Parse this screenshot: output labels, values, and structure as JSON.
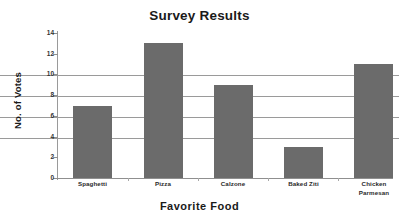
{
  "chart_data": {
    "type": "bar",
    "title": "Survey Results",
    "xlabel": "Favorite Food",
    "ylabel": "No. of Votes",
    "categories": [
      "Spaghetti",
      "Pizza",
      "Calzone",
      "Baked Ziti",
      "Chicken Parmesan"
    ],
    "values": [
      7,
      13,
      9,
      3,
      11
    ],
    "series": [
      {
        "name": "No. of Votes",
        "values": [
          7,
          13,
          9,
          3,
          11
        ]
      }
    ],
    "ylim": [
      0,
      14
    ],
    "yticks": [
      0,
      2,
      4,
      6,
      8,
      10,
      12,
      14
    ],
    "ytick_labels": [
      "0",
      "2",
      "4",
      "6",
      "8",
      "10",
      "12",
      "14"
    ],
    "grid": true,
    "grid_axis": "y",
    "legend": false,
    "bar_color": "#6b6b6b",
    "grid_color": "#9a9a9a",
    "background": "#ffffff"
  },
  "labels": {
    "category_0": "Spaghetti",
    "category_1": "Pizza",
    "category_2": "Calzone",
    "category_3": "Baked Ziti",
    "category_4_line1": "Chicken",
    "category_4_line2": "Parmesan"
  },
  "yticks": {
    "t0": "0",
    "t1": "2",
    "t2": "4",
    "t3": "6",
    "t4": "8",
    "t5": "10",
    "t6": "12",
    "t7": "14"
  }
}
